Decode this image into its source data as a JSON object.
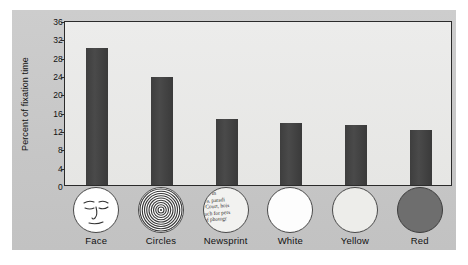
{
  "chart_data": {
    "type": "bar",
    "title": "",
    "xlabel": "",
    "ylabel": "Percent of fixation time",
    "categories": [
      "Face",
      "Circles",
      "Newsprint",
      "White",
      "Yellow",
      "Red"
    ],
    "values": [
      30,
      23.5,
      14.5,
      13.5,
      13,
      12
    ],
    "ylim": [
      0,
      36
    ],
    "yticks": [
      0,
      4,
      8,
      12,
      16,
      20,
      24,
      28,
      32,
      36
    ],
    "ytick_labels": [
      "0",
      "4",
      "8",
      "12",
      "16",
      "20",
      "24",
      "28",
      "32",
      "36"
    ],
    "grid": false,
    "legend": "none",
    "bar_color": "#3f3f3f",
    "plot_background": "#e8e8e6",
    "panel_background": "#c9c9c9"
  },
  "stimuli": [
    {
      "name": "Face",
      "icon": "face-disc-icon",
      "swatch": "#ffffff"
    },
    {
      "name": "Circles",
      "icon": "concentric-circles-disc-icon",
      "swatch": "#ffffff"
    },
    {
      "name": "Newsprint",
      "icon": "newsprint-disc-icon",
      "swatch": "#f2f2f0"
    },
    {
      "name": "White",
      "icon": "white-disc-icon",
      "swatch": "#fdfdfd"
    },
    {
      "name": "Yellow",
      "icon": "yellow-disc-icon",
      "swatch": "#ededea"
    },
    {
      "name": "Red",
      "icon": "red-disc-icon",
      "swatch": "#6e6e6e"
    }
  ],
  "newsprint_lines": [
    "nable m",
    "lova, paradi",
    "re Court, hois",
    "much for pers",
    "s of photogr",
    "blitz"
  ]
}
